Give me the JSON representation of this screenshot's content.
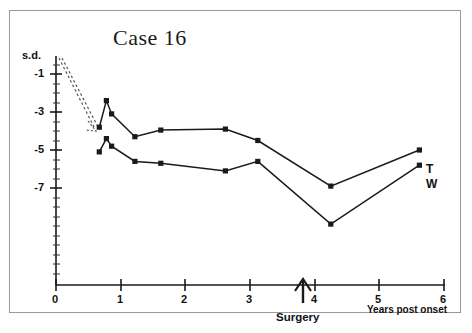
{
  "chart_data": {
    "type": "line",
    "title": "Case 16",
    "xlabel": "Years post onset",
    "ylabel": "s.d.",
    "xlim": [
      0,
      6
    ],
    "ylim": [
      -12.1,
      0.1
    ],
    "grid": false,
    "legend_position": "right-inline",
    "xticks": [
      "0",
      "1",
      "2",
      "3",
      "4",
      "5",
      "6"
    ],
    "xtick_values": [
      0,
      1,
      2,
      3,
      4,
      5,
      6
    ],
    "yticks": [
      "-1",
      "-3",
      "-5",
      "-7"
    ],
    "ytick_values": [
      -1,
      -3,
      -5,
      -7
    ],
    "y_minor_step": 0.5,
    "series": [
      {
        "name": "T",
        "label": "T",
        "color": "#1a1a1a",
        "marker": "square",
        "points": [
          {
            "x": 0.67,
            "y": -3.8
          },
          {
            "x": 0.78,
            "y": -2.4
          },
          {
            "x": 0.86,
            "y": -3.1
          },
          {
            "x": 1.22,
            "y": -4.3
          },
          {
            "x": 1.62,
            "y": -3.95
          },
          {
            "x": 2.62,
            "y": -3.9
          },
          {
            "x": 3.12,
            "y": -4.5
          },
          {
            "x": 4.25,
            "y": -6.9
          },
          {
            "x": 5.62,
            "y": -5.0
          }
        ]
      },
      {
        "name": "W",
        "label": "W",
        "color": "#1a1a1a",
        "marker": "square",
        "points": [
          {
            "x": 0.67,
            "y": -5.1
          },
          {
            "x": 0.78,
            "y": -4.4
          },
          {
            "x": 0.86,
            "y": -4.8
          },
          {
            "x": 1.22,
            "y": -5.6
          },
          {
            "x": 1.62,
            "y": -5.7
          },
          {
            "x": 2.62,
            "y": -6.1
          },
          {
            "x": 3.12,
            "y": -5.6
          },
          {
            "x": 4.25,
            "y": -8.9
          },
          {
            "x": 5.62,
            "y": -5.8
          }
        ]
      }
    ],
    "annotations": [
      {
        "name": "surgery-marker",
        "label": "Surgery",
        "x": 3.8,
        "type": "up-arrow"
      },
      {
        "name": "onset-decline-arrow",
        "label": "",
        "type": "dotted-arrow",
        "from": {
          "x": 0.02,
          "y": -0.15
        },
        "to": {
          "x": 0.62,
          "y": -3.85
        }
      }
    ]
  },
  "chart": {
    "title": "Case 16",
    "y_axis_unit": "s.d.",
    "x_axis_title": "Years post onset",
    "surgery_label": "Surgery",
    "series_label_t": "T",
    "series_label_w": "W",
    "ytick_1": "-1",
    "ytick_3": "-3",
    "ytick_5": "-5",
    "ytick_7": "-7",
    "xtick_0": "0",
    "xtick_1": "1",
    "xtick_2": "2",
    "xtick_3": "3",
    "xtick_4": "4",
    "xtick_5": "5",
    "xtick_6": "6"
  }
}
